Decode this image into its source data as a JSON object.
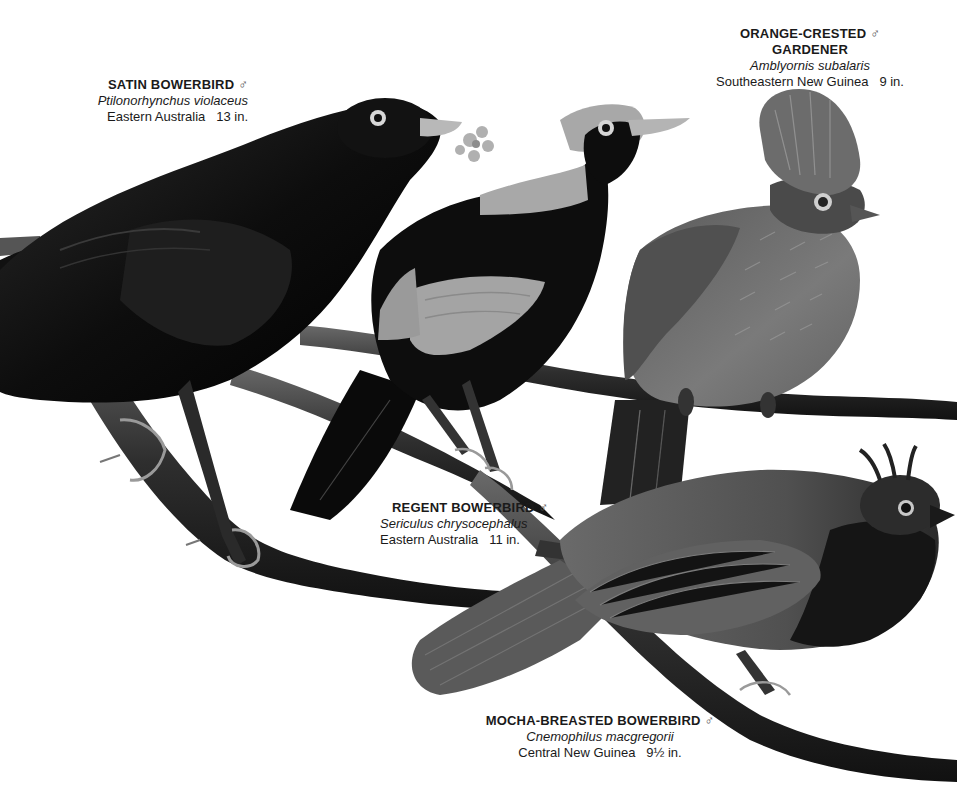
{
  "plate": {
    "background": "#ffffff",
    "palette": {
      "black_plumage": "#0c0c0c",
      "gold_mantle": "#a9a9a9",
      "olive_body": "#6e6e6e",
      "mocha_body": "#555555",
      "branch": "#3a3a3a",
      "bill": "#b8b8b8"
    }
  },
  "birds": [
    {
      "name": "SATIN BOWERBIRD",
      "sex_symbol": "♂",
      "scientific": "Ptilonorhynchus violaceus",
      "range": "Eastern Australia",
      "size": "13 in."
    },
    {
      "name": "ORANGE-CRESTED",
      "name_line2": "GARDENER",
      "sex_symbol": "♂",
      "scientific": "Amblyornis subalaris",
      "range": "Southeastern New Guinea",
      "size": "9 in."
    },
    {
      "name": "REGENT BOWERBIRD",
      "sex_symbol": "♂",
      "scientific": "Sericulus chrysocephalus",
      "range": "Eastern Australia",
      "size": "11 in."
    },
    {
      "name": "MOCHA-BREASTED BOWERBIRD",
      "sex_symbol": "♂",
      "scientific": "Cnemophilus macgregorii",
      "range": "Central New Guinea",
      "size": "9½ in."
    }
  ]
}
